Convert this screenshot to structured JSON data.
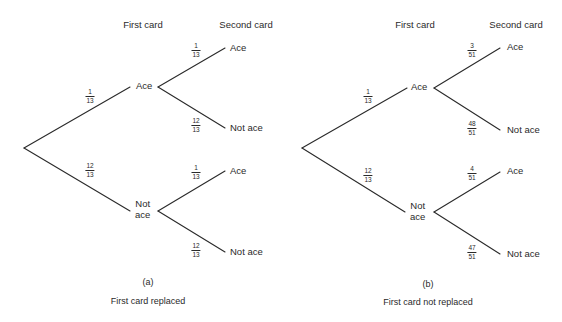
{
  "diagram": {
    "type": "probability-tree",
    "panels": [
      {
        "id": "a",
        "headers": {
          "first": "First card",
          "second": "Second card"
        },
        "first_level": [
          {
            "label": "Ace",
            "prob": {
              "num": "1",
              "den": "13"
            }
          },
          {
            "label_line1": "Not",
            "label_line2": "ace",
            "prob": {
              "num": "12",
              "den": "13"
            }
          }
        ],
        "second_level": [
          {
            "parent": "Ace",
            "label": "Ace",
            "prob": {
              "num": "1",
              "den": "13"
            }
          },
          {
            "parent": "Ace",
            "label": "Not ace",
            "prob": {
              "num": "12",
              "den": "13"
            }
          },
          {
            "parent": "Not ace",
            "label": "Ace",
            "prob": {
              "num": "1",
              "den": "13"
            }
          },
          {
            "parent": "Not ace",
            "label": "Not ace",
            "prob": {
              "num": "12",
              "den": "13"
            }
          }
        ],
        "tag": "(a)",
        "caption": "First card replaced"
      },
      {
        "id": "b",
        "headers": {
          "first": "First card",
          "second": "Second card"
        },
        "first_level": [
          {
            "label": "Ace",
            "prob": {
              "num": "1",
              "den": "13"
            }
          },
          {
            "label_line1": "Not",
            "label_line2": "ace",
            "prob": {
              "num": "12",
              "den": "13"
            }
          }
        ],
        "second_level": [
          {
            "parent": "Ace",
            "label": "Ace",
            "prob": {
              "num": "3",
              "den": "51"
            }
          },
          {
            "parent": "Ace",
            "label": "Not ace",
            "prob": {
              "num": "48",
              "den": "51"
            }
          },
          {
            "parent": "Not ace",
            "label": "Ace",
            "prob": {
              "num": "4",
              "den": "51"
            }
          },
          {
            "parent": "Not ace",
            "label": "Not ace",
            "prob": {
              "num": "47",
              "den": "51"
            }
          }
        ],
        "tag": "(b)",
        "caption": "First card not replaced"
      }
    ]
  },
  "colors": {
    "ink": "#2a2a2a",
    "background": "#ffffff"
  }
}
